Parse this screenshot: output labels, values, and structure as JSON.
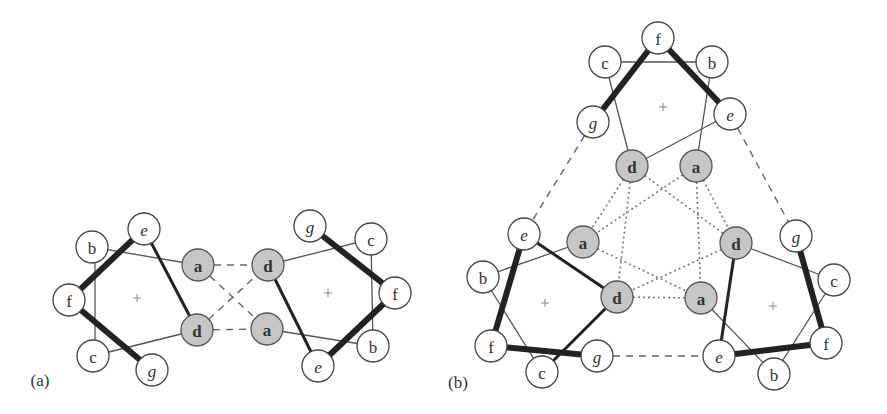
{
  "figure": {
    "panel_a_label": "(a)",
    "panel_b_label": "(b)"
  },
  "colors": {
    "gray_node": "#c6c6c6",
    "white_node": "#ffffff",
    "stroke": "#222222"
  },
  "panel_a": {
    "left_wheel": {
      "nodes": [
        {
          "id": "aL_e",
          "label": "e",
          "x": 144,
          "y": 229,
          "style": "italic"
        },
        {
          "id": "aL_b",
          "label": "b",
          "x": 92,
          "y": 247,
          "style": "normal"
        },
        {
          "id": "aL_f",
          "label": "f",
          "x": 69,
          "y": 300,
          "style": "normal"
        },
        {
          "id": "aL_c",
          "label": "c",
          "x": 93,
          "y": 356,
          "style": "normal"
        },
        {
          "id": "aL_g",
          "label": "g",
          "x": 152,
          "y": 370,
          "style": "italic"
        },
        {
          "id": "aL_a",
          "label": "a",
          "x": 198,
          "y": 265,
          "style": "gray"
        },
        {
          "id": "aL_d",
          "label": "d",
          "x": 197,
          "y": 330,
          "style": "gray"
        }
      ],
      "center": {
        "x": 137,
        "y": 298
      }
    },
    "right_wheel": {
      "nodes": [
        {
          "id": "aR_g",
          "label": "g",
          "x": 310,
          "y": 226,
          "style": "italic"
        },
        {
          "id": "aR_c",
          "label": "c",
          "x": 371,
          "y": 239,
          "style": "normal"
        },
        {
          "id": "aR_d",
          "label": "d",
          "x": 268,
          "y": 265,
          "style": "gray"
        },
        {
          "id": "aR_f",
          "label": "f",
          "x": 395,
          "y": 293,
          "style": "normal"
        },
        {
          "id": "aR_a",
          "label": "a",
          "x": 267,
          "y": 329,
          "style": "gray"
        },
        {
          "id": "aR_b",
          "label": "b",
          "x": 373,
          "y": 346,
          "style": "normal"
        },
        {
          "id": "aR_e",
          "label": "e",
          "x": 318,
          "y": 366,
          "style": "italic"
        }
      ],
      "center": {
        "x": 328,
        "y": 293
      }
    }
  },
  "panel_b": {
    "top_wheel": {
      "nodes": [
        {
          "id": "bT_f",
          "label": "f",
          "x": 658,
          "y": 38,
          "style": "normal"
        },
        {
          "id": "bT_c",
          "label": "c",
          "x": 605,
          "y": 62,
          "style": "normal"
        },
        {
          "id": "bT_b",
          "label": "b",
          "x": 712,
          "y": 62,
          "style": "normal"
        },
        {
          "id": "bT_g",
          "label": "g",
          "x": 593,
          "y": 122,
          "style": "italic"
        },
        {
          "id": "bT_e",
          "label": "e",
          "x": 730,
          "y": 114,
          "style": "italic"
        },
        {
          "id": "bT_d",
          "label": "d",
          "x": 632,
          "y": 166,
          "style": "gray"
        },
        {
          "id": "bT_a",
          "label": "a",
          "x": 696,
          "y": 166,
          "style": "gray"
        }
      ],
      "center": {
        "x": 663,
        "y": 107
      }
    },
    "left_wheel": {
      "nodes": [
        {
          "id": "bL_e",
          "label": "e",
          "x": 524,
          "y": 234,
          "style": "italic"
        },
        {
          "id": "bL_a",
          "label": "a",
          "x": 583,
          "y": 242,
          "style": "gray"
        },
        {
          "id": "bL_b",
          "label": "b",
          "x": 483,
          "y": 277,
          "style": "normal"
        },
        {
          "id": "bL_d",
          "label": "d",
          "x": 617,
          "y": 297,
          "style": "gray"
        },
        {
          "id": "bL_f",
          "label": "f",
          "x": 491,
          "y": 346,
          "style": "normal"
        },
        {
          "id": "bL_g",
          "label": "g",
          "x": 597,
          "y": 356,
          "style": "italic"
        },
        {
          "id": "bL_c",
          "label": "c",
          "x": 542,
          "y": 372,
          "style": "normal"
        }
      ],
      "center": {
        "x": 545,
        "y": 303
      }
    },
    "right_wheel": {
      "nodes": [
        {
          "id": "bR_g",
          "label": "g",
          "x": 796,
          "y": 236,
          "style": "italic"
        },
        {
          "id": "bR_d",
          "label": "d",
          "x": 736,
          "y": 243,
          "style": "gray"
        },
        {
          "id": "bR_c",
          "label": "c",
          "x": 834,
          "y": 280,
          "style": "normal"
        },
        {
          "id": "bR_a",
          "label": "a",
          "x": 701,
          "y": 298,
          "style": "gray"
        },
        {
          "id": "bR_f",
          "label": "f",
          "x": 826,
          "y": 343,
          "style": "normal"
        },
        {
          "id": "bR_e",
          "label": "e",
          "x": 719,
          "y": 356,
          "style": "italic"
        },
        {
          "id": "bR_b",
          "label": "b",
          "x": 774,
          "y": 374,
          "style": "normal"
        }
      ],
      "center": {
        "x": 773,
        "y": 306
      }
    }
  },
  "edges": [
    {
      "from": "aL_b",
      "to": "aL_a",
      "type": "thin"
    },
    {
      "from": "aL_b",
      "to": "aL_c",
      "type": "thin",
      "vertical_offset": 3
    },
    {
      "from": "aL_c",
      "to": "aL_d",
      "type": "thin"
    },
    {
      "from": "aL_f",
      "to": "aL_e",
      "type": "thick"
    },
    {
      "from": "aL_f",
      "to": "aL_g",
      "type": "thick"
    },
    {
      "from": "aL_e",
      "to": "aL_d",
      "type": "med"
    },
    {
      "from": "aR_d",
      "to": "aR_c",
      "type": "thin"
    },
    {
      "from": "aR_c",
      "to": "aR_b",
      "type": "thin"
    },
    {
      "from": "aR_a",
      "to": "aR_b",
      "type": "thin"
    },
    {
      "from": "aR_g",
      "to": "aR_f",
      "type": "thick"
    },
    {
      "from": "aR_f",
      "to": "aR_e",
      "type": "thick"
    },
    {
      "from": "aR_d",
      "to": "aR_e",
      "type": "med"
    },
    {
      "from": "aL_a",
      "to": "aR_d",
      "type": "dashed_short"
    },
    {
      "from": "aL_d",
      "to": "aR_a",
      "type": "dashed_short"
    },
    {
      "from": "aL_a",
      "to": "aR_a",
      "type": "dashed_short"
    },
    {
      "from": "aL_d",
      "to": "aR_d",
      "type": "dashed_short"
    },
    {
      "from": "bT_c",
      "to": "bT_b",
      "type": "thin"
    },
    {
      "from": "bT_c",
      "to": "bT_d",
      "type": "thin"
    },
    {
      "from": "bT_b",
      "to": "bT_a",
      "type": "thin"
    },
    {
      "from": "bT_e",
      "to": "bT_d",
      "type": "thin"
    },
    {
      "from": "bT_g",
      "to": "bT_f",
      "type": "thick"
    },
    {
      "from": "bT_f",
      "to": "bT_e",
      "type": "thick"
    },
    {
      "from": "bL_b",
      "to": "bL_a",
      "type": "thin"
    },
    {
      "from": "bL_b",
      "to": "bL_c",
      "type": "thin"
    },
    {
      "from": "bL_c",
      "to": "bL_d",
      "type": "med"
    },
    {
      "from": "bL_e",
      "to": "bL_d",
      "type": "med"
    },
    {
      "from": "bL_e",
      "to": "bL_f",
      "type": "thick"
    },
    {
      "from": "bL_f",
      "to": "bL_g",
      "type": "thick"
    },
    {
      "from": "bR_d",
      "to": "bR_c",
      "type": "thin"
    },
    {
      "from": "bR_a",
      "to": "bR_b",
      "type": "thin"
    },
    {
      "from": "bR_c",
      "to": "bR_b",
      "type": "thin"
    },
    {
      "from": "bR_d",
      "to": "bR_e",
      "type": "med"
    },
    {
      "from": "bR_e",
      "to": "bR_f",
      "type": "thick"
    },
    {
      "from": "bR_g",
      "to": "bR_f",
      "type": "thick"
    },
    {
      "from": "bT_d",
      "to": "bL_a",
      "type": "dotted"
    },
    {
      "from": "bT_d",
      "to": "bL_d",
      "type": "dotted"
    },
    {
      "from": "bT_d",
      "to": "bR_d",
      "type": "dotted"
    },
    {
      "from": "bT_a",
      "to": "bL_a",
      "type": "dotted"
    },
    {
      "from": "bT_a",
      "to": "bR_a",
      "type": "dotted"
    },
    {
      "from": "bT_a",
      "to": "bR_d",
      "type": "dotted"
    },
    {
      "from": "bL_a",
      "to": "bR_a",
      "type": "dotted"
    },
    {
      "from": "bR_d",
      "to": "bL_d",
      "type": "dotted"
    },
    {
      "from": "bL_d",
      "to": "bR_a",
      "type": "dotted"
    },
    {
      "from": "bT_g",
      "to": "bL_e",
      "type": "dashed"
    },
    {
      "from": "bT_e",
      "to": "bR_g",
      "type": "dashed"
    },
    {
      "from": "bL_g",
      "to": "bR_e",
      "type": "dashed"
    }
  ]
}
